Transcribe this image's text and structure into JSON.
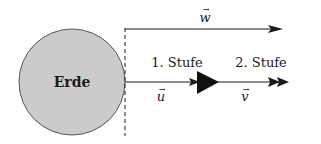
{
  "diagram": {
    "earth": {
      "label": "Erde",
      "fill": "#c8c8c8",
      "stroke": "#555555"
    },
    "vectors": {
      "w": {
        "label": "w",
        "arrow": "→"
      },
      "u": {
        "label": "u",
        "arrow": "→"
      },
      "v": {
        "label": "v",
        "arrow": "→"
      }
    },
    "stages": [
      {
        "label": "1. Stufe"
      },
      {
        "label": "2. Stufe"
      }
    ],
    "colors": {
      "line": "#1a1a1a",
      "dashed": "#1a1a1a"
    }
  }
}
